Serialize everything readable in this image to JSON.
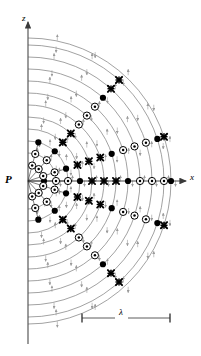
{
  "figure": {
    "type": "physics-wave-radiation-diagram",
    "background_color": "#ffffff",
    "arc_color": "#7a7a7a",
    "axis_color": "#555555",
    "symbol_color": "#000000",
    "arrow_color": "#9a9a9a"
  },
  "labels": {
    "z_axis": "z",
    "x_axis": "x",
    "source_point": "P",
    "wavelength": "λ"
  },
  "axes": {
    "origin": {
      "x": 28,
      "y": 181
    },
    "z_axis": {
      "x": 28,
      "y_top": 22,
      "y_bottom": 344,
      "arrow_at_top": true
    },
    "x_axis": {
      "y": 181,
      "x_left": 28,
      "x_right": 186,
      "arrow_at_right": true
    }
  },
  "scale_bar": {
    "y": 318,
    "x_start": 82,
    "x_end": 170,
    "label": "λ",
    "label_x": 119,
    "tick_height": 9
  },
  "wavefronts": {
    "count": 12,
    "center": {
      "x": 28,
      "y": 181
    },
    "radii": [
      16,
      28,
      40,
      52,
      64,
      76,
      88,
      100,
      112,
      124,
      136,
      143
    ],
    "stroke_width": 0.7
  },
  "symbol_legend": [
    {
      "name": "filled-dot",
      "glyph": "●",
      "meaning": "maximum field out of page"
    },
    {
      "name": "circled-dot",
      "glyph": "⊙",
      "meaning": "field vector out of page"
    },
    {
      "name": "cross",
      "glyph": "✖",
      "meaning": "field vector into page"
    }
  ],
  "rays": [
    {
      "name": "ray-axis-right",
      "angle_deg": 0,
      "markers": [
        {
          "t": "dot",
          "r": 16
        },
        {
          "t": "odot",
          "r": 28
        },
        {
          "t": "odot",
          "r": 40
        },
        {
          "t": "dot",
          "r": 52
        },
        {
          "t": "x",
          "r": 64
        },
        {
          "t": "x",
          "r": 76
        },
        {
          "t": "x",
          "r": 88
        },
        {
          "t": "dot",
          "r": 100
        },
        {
          "t": "odot",
          "r": 112
        },
        {
          "t": "odot",
          "r": 124
        },
        {
          "t": "odot",
          "r": 136
        },
        {
          "t": "dot",
          "r": 143
        }
      ]
    },
    {
      "name": "ray-up-15",
      "angle_deg": 18,
      "markers": [
        {
          "t": "odot",
          "r": 16
        },
        {
          "t": "odot",
          "r": 28
        },
        {
          "t": "dot",
          "r": 40
        },
        {
          "t": "x",
          "r": 52
        },
        {
          "t": "x",
          "r": 64
        },
        {
          "t": "x",
          "r": 76
        },
        {
          "t": "dot",
          "r": 88
        },
        {
          "t": "odot",
          "r": 100
        },
        {
          "t": "odot",
          "r": 112
        },
        {
          "t": "odot",
          "r": 124
        },
        {
          "t": "dot",
          "r": 136
        },
        {
          "t": "x",
          "r": 143
        }
      ]
    },
    {
      "name": "ray-up-45",
      "angle_deg": 48,
      "markers": [
        {
          "t": "odot",
          "r": 16
        },
        {
          "t": "odot",
          "r": 28
        },
        {
          "t": "dot",
          "r": 40
        },
        {
          "t": "x",
          "r": 52
        },
        {
          "t": "x",
          "r": 64
        },
        {
          "t": "odot",
          "r": 76
        },
        {
          "t": "odot",
          "r": 88
        },
        {
          "t": "odot",
          "r": 100
        },
        {
          "t": "dot",
          "r": 112
        },
        {
          "t": "x",
          "r": 124
        },
        {
          "t": "x",
          "r": 136
        }
      ]
    },
    {
      "name": "ray-up-75",
      "angle_deg": 75,
      "markers": [
        {
          "t": "odot",
          "r": 16
        },
        {
          "t": "odot",
          "r": 28
        },
        {
          "t": "dot",
          "r": 40
        }
      ]
    },
    {
      "name": "ray-down-15",
      "angle_deg": -18,
      "markers": [
        {
          "t": "odot",
          "r": 16
        },
        {
          "t": "odot",
          "r": 28
        },
        {
          "t": "dot",
          "r": 40
        },
        {
          "t": "x",
          "r": 52
        },
        {
          "t": "x",
          "r": 64
        },
        {
          "t": "x",
          "r": 76
        },
        {
          "t": "dot",
          "r": 88
        },
        {
          "t": "odot",
          "r": 100
        },
        {
          "t": "odot",
          "r": 112
        },
        {
          "t": "odot",
          "r": 124
        },
        {
          "t": "dot",
          "r": 136
        },
        {
          "t": "x",
          "r": 143
        }
      ]
    },
    {
      "name": "ray-down-45",
      "angle_deg": -48,
      "markers": [
        {
          "t": "odot",
          "r": 16
        },
        {
          "t": "odot",
          "r": 28
        },
        {
          "t": "dot",
          "r": 40
        },
        {
          "t": "x",
          "r": 52
        },
        {
          "t": "x",
          "r": 64
        },
        {
          "t": "odot",
          "r": 76
        },
        {
          "t": "odot",
          "r": 88
        },
        {
          "t": "odot",
          "r": 100
        },
        {
          "t": "dot",
          "r": 112
        },
        {
          "t": "x",
          "r": 124
        },
        {
          "t": "x",
          "r": 136
        }
      ]
    },
    {
      "name": "ray-down-75",
      "angle_deg": -75,
      "markers": [
        {
          "t": "odot",
          "r": 16
        },
        {
          "t": "odot",
          "r": 28
        },
        {
          "t": "dot",
          "r": 40
        }
      ]
    }
  ],
  "source_rays_from_P": {
    "count": 7,
    "angles_deg": [
      75,
      48,
      18,
      0,
      -18,
      -48,
      -75
    ],
    "length": 42
  }
}
